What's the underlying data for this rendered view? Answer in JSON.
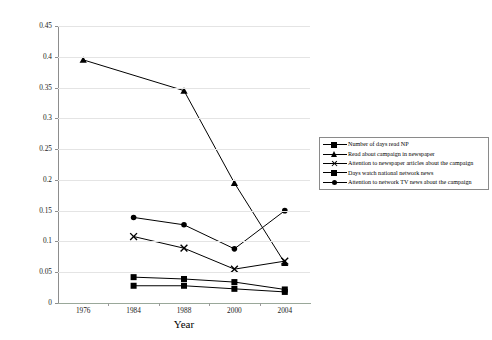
{
  "chart_data": {
    "type": "line",
    "title": "",
    "xlabel": "Year",
    "ylabel": "",
    "categories": [
      "1976",
      "1984",
      "1988",
      "2000",
      "2004"
    ],
    "ylim": [
      0,
      0.45
    ],
    "ytick_step": 0.05,
    "yticks": [
      "0",
      "0.05",
      "0.1",
      "0.15",
      "0.2",
      "0.25",
      "0.3",
      "0.35",
      "0.4",
      "0.45"
    ],
    "grid": true,
    "legend_position": "right",
    "series": [
      {
        "name": "Number of days read NP",
        "marker": "square",
        "color": "#000000",
        "values": [
          null,
          0.028,
          0.028,
          0.023,
          0.018
        ]
      },
      {
        "name": "Read about campaign in newspaper",
        "marker": "triangle",
        "color": "#000000",
        "values": [
          0.395,
          null,
          0.345,
          0.195,
          0.065
        ]
      },
      {
        "name": "Attention to newspaper articles about the campaign",
        "marker": "x",
        "color": "#000000",
        "values": [
          null,
          0.108,
          0.089,
          0.055,
          0.068
        ]
      },
      {
        "name": "Days watch national network news",
        "marker": "square",
        "color": "#000000",
        "values": [
          null,
          0.042,
          0.039,
          0.034,
          0.022
        ]
      },
      {
        "name": "Attention to network TV news about the campaign",
        "marker": "circle",
        "color": "#000000",
        "values": [
          null,
          0.139,
          0.127,
          0.088,
          0.15
        ]
      }
    ]
  },
  "axis": {
    "x_title": "Year"
  }
}
